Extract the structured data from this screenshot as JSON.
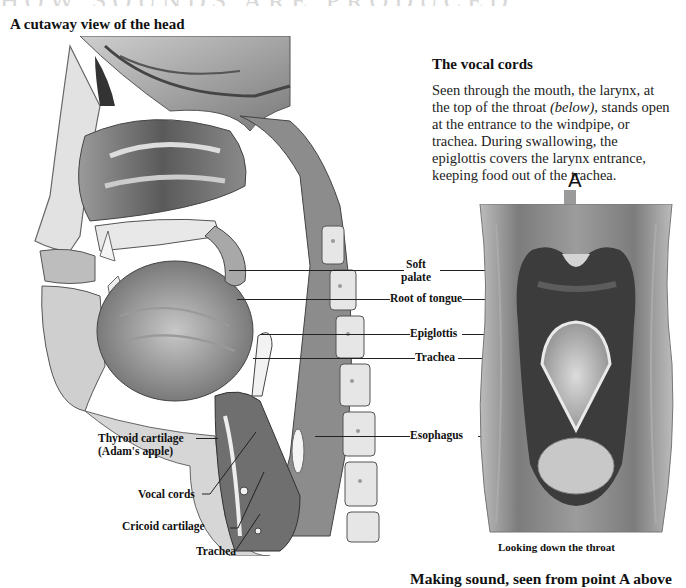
{
  "page": {
    "cut_off_heading": "HOW SOUNDS ARE PRODUCED",
    "left_section": {
      "title": "A cutaway view of the head",
      "illustration": "head-cutaway-illustration"
    },
    "right_section": {
      "title": "The vocal cords",
      "body_before": "Seen through the mouth, the larynx, at the top of the throat ",
      "body_italic": "(below)",
      "body_after": ", stands open at the entrance to the windpipe, or trachea. During swallowing, the epiglottis covers the larynx entrance, keeping food out of the trachea.",
      "illustration": "throat-view-illustration",
      "arrow_label": "A",
      "arrow_color": "#9a9a9a",
      "caption": "Looking down the throat"
    },
    "center_labels": [
      {
        "id": "soft-palate",
        "line1": "Soft",
        "line2": "palate"
      },
      {
        "id": "root-of-tongue",
        "text": "Root of tongue"
      },
      {
        "id": "epiglottis",
        "text": "Epiglottis"
      },
      {
        "id": "trachea",
        "text": "Trachea"
      },
      {
        "id": "esophagus",
        "text": "Esophagus"
      }
    ],
    "left_labels": [
      {
        "id": "thyroid-cartilage",
        "line1": "Thyroid cartilage",
        "line2": "(Adam's apple)"
      },
      {
        "id": "vocal-cords",
        "text": "Vocal cords"
      },
      {
        "id": "cricoid-cartilage",
        "text": "Cricoid cartilage"
      },
      {
        "id": "trachea-lower",
        "text": "Trachea"
      }
    ],
    "bottom_caption": "Making sound, seen from point A above"
  }
}
